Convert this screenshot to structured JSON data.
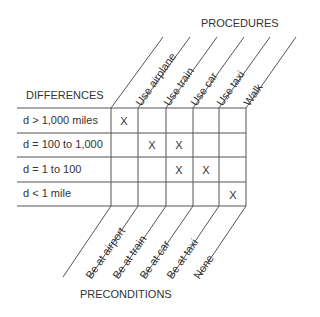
{
  "titles": {
    "procedures": "PROCEDURES",
    "differences": "DIFFERENCES",
    "preconditions": "PRECONDITIONS"
  },
  "procedures": [
    "Use airplane",
    "Use train",
    "Use car",
    "Use taxi",
    "Walk"
  ],
  "preconditions": [
    "Be at airport",
    "Be at train",
    "Be at car",
    "Be at taxi",
    "None"
  ],
  "differences": [
    "d > 1,000 miles",
    "d = 100 to 1,000",
    "d = 1 to 100",
    "d < 1 mile"
  ],
  "matrix_mark": "X",
  "matrix": [
    [
      true,
      false,
      false,
      false,
      false
    ],
    [
      false,
      true,
      true,
      false,
      false
    ],
    [
      false,
      false,
      true,
      true,
      false
    ],
    [
      false,
      false,
      false,
      false,
      true
    ]
  ]
}
